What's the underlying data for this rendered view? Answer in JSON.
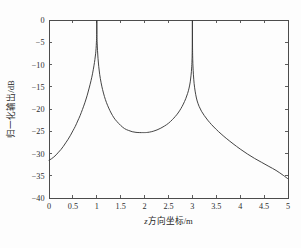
{
  "figure": {
    "background_color": "#fdfdfd",
    "axis_color": "#4c4c4c",
    "curve_color": "#3a3a3a"
  },
  "chart_data": {
    "type": "line",
    "title": "",
    "subtitle": "",
    "xlabel": "z方向坐标/m",
    "xlabel_variable": "z",
    "xlabel_rest": "方向坐标/m",
    "ylabel": "归一化输出/dB",
    "xlim": [
      0,
      5
    ],
    "ylim": [
      -40,
      0
    ],
    "grid": false,
    "legend": null,
    "legend_position": "none",
    "xticks": [
      0,
      0.5,
      1,
      1.5,
      2,
      2.5,
      3,
      3.5,
      4,
      4.5,
      5
    ],
    "xticklabels": [
      "0",
      "0.5",
      "1",
      "1.5",
      "2",
      "2.5",
      "3",
      "3.5",
      "4",
      "4.5",
      "5"
    ],
    "yticks": [
      0,
      -5,
      -10,
      -15,
      -20,
      -25,
      -30,
      -35,
      -40
    ],
    "yticklabels": [
      "0",
      "−5",
      "−10",
      "−15",
      "−20",
      "−25",
      "−30",
      "−35",
      "−40"
    ],
    "series": [
      {
        "name": "归一化输出",
        "x": [
          0.0,
          0.05,
          0.1,
          0.15,
          0.2,
          0.25,
          0.3,
          0.35,
          0.4,
          0.45,
          0.5,
          0.55,
          0.6,
          0.65,
          0.7,
          0.75,
          0.8,
          0.84,
          0.88,
          0.91,
          0.94,
          0.96,
          0.975,
          0.985,
          0.992,
          0.997,
          1.0,
          1.003,
          1.008,
          1.015,
          1.025,
          1.04,
          1.06,
          1.09,
          1.12,
          1.16,
          1.2,
          1.25,
          1.3,
          1.36,
          1.42,
          1.5,
          1.58,
          1.66,
          1.74,
          1.82,
          1.9,
          1.96,
          2.0,
          2.04,
          2.1,
          2.18,
          2.26,
          2.34,
          2.42,
          2.5,
          2.58,
          2.64,
          2.7,
          2.76,
          2.81,
          2.86,
          2.9,
          2.93,
          2.955,
          2.972,
          2.984,
          2.992,
          2.997,
          3.0,
          3.003,
          3.008,
          3.016,
          3.028,
          3.045,
          3.07,
          3.1,
          3.14,
          3.19,
          3.25,
          3.32,
          3.4,
          3.5,
          3.6,
          3.72,
          3.85,
          4.0,
          4.15,
          4.3,
          4.45,
          4.6,
          4.75,
          4.9,
          5.0
        ],
        "y": [
          -31.5,
          -31.2,
          -30.8,
          -30.3,
          -29.7,
          -29.1,
          -28.4,
          -27.6,
          -26.8,
          -25.9,
          -24.9,
          -23.9,
          -22.7,
          -21.5,
          -20.1,
          -18.6,
          -16.9,
          -15.3,
          -13.6,
          -12.1,
          -10.3,
          -8.9,
          -7.6,
          -6.4,
          -5.0,
          -3.2,
          0.0,
          -3.3,
          -5.2,
          -6.9,
          -8.6,
          -10.4,
          -12.2,
          -14.1,
          -15.6,
          -17.2,
          -18.5,
          -19.8,
          -20.9,
          -22.0,
          -22.8,
          -23.7,
          -24.4,
          -24.8,
          -25.1,
          -25.25,
          -25.3,
          -25.3,
          -25.3,
          -25.28,
          -25.2,
          -25.0,
          -24.7,
          -24.3,
          -23.8,
          -23.2,
          -22.4,
          -21.7,
          -20.9,
          -19.9,
          -18.9,
          -17.7,
          -16.5,
          -15.3,
          -13.9,
          -12.4,
          -10.8,
          -9.0,
          -6.2,
          0.0,
          -6.3,
          -9.2,
          -11.3,
          -13.3,
          -15.1,
          -16.8,
          -18.2,
          -19.4,
          -20.5,
          -21.5,
          -22.5,
          -23.5,
          -24.6,
          -25.6,
          -26.7,
          -27.8,
          -29.0,
          -30.1,
          -31.1,
          -32.0,
          -32.9,
          -33.8,
          -34.9,
          -35.7
        ],
        "peaks": [
          {
            "x": 1.0,
            "y": 0.0
          },
          {
            "x": 3.0,
            "y": 0.0
          }
        ],
        "minimum": {
          "x": 2.0,
          "y": -25.3
        },
        "endpoints": [
          {
            "x": 0.0,
            "y": -31.5
          },
          {
            "x": 5.0,
            "y": -35.7
          }
        ]
      }
    ]
  }
}
